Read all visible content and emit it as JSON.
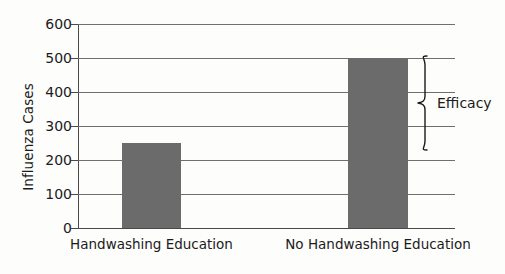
{
  "chart_data": {
    "type": "bar",
    "title": "",
    "xlabel": "",
    "ylabel": "Influenza Cases",
    "categories": [
      "Handwashing Education",
      "No Handwashing Education"
    ],
    "values": [
      250,
      500
    ],
    "ylim": [
      0,
      600
    ],
    "ytick_step": 100,
    "yticks": [
      0,
      100,
      200,
      300,
      400,
      500,
      600
    ],
    "ytick_labels": [
      "0",
      "100",
      "200",
      "300",
      "400",
      "500",
      "600"
    ],
    "grid": "horizontal",
    "legend": "none",
    "bar_color": "#6b6b6b",
    "axis_color": "#4a4a4a",
    "grid_color": "#6f6f6f",
    "text_color": "#1b1b1b",
    "background": "#fdfdfc",
    "annotations": [
      {
        "label": "Efficacy",
        "type": "brace",
        "from_value": 250,
        "to_value": 500,
        "span": 250,
        "attached_to": "No Handwashing Education"
      }
    ]
  }
}
